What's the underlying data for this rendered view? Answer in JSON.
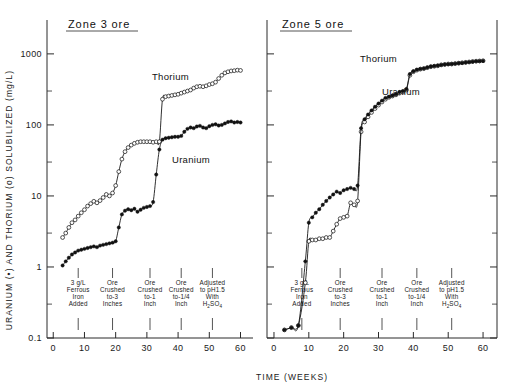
{
  "figure": {
    "width": 510,
    "height": 389,
    "background": "#ffffff",
    "ink_color": "#1a1a1a"
  },
  "axes": {
    "x_title": "TIME (WEEKS)",
    "y_title": "URANIUM (•) AND THORIUM (o) SOLUBILIZED (mg/L)",
    "x_ticks": [
      0,
      10,
      20,
      30,
      40,
      50,
      60
    ],
    "x_ticklabels": [
      "0",
      "10",
      "20",
      "30",
      "40",
      "50",
      "60"
    ],
    "y_ticks": [
      0.1,
      1,
      10,
      100,
      1000
    ],
    "y_ticklabels": [
      "0.1",
      "1",
      "10",
      "100",
      "1000"
    ],
    "y_scale": "log",
    "y_limits": [
      0.1,
      3000
    ],
    "x_limits": [
      -2,
      64
    ],
    "grid": false
  },
  "legend": {
    "position": "inline-annotation",
    "entries": [
      {
        "name": "Thorium",
        "marker": "open-circle"
      },
      {
        "name": "Uranium",
        "marker": "filled-circle"
      }
    ]
  },
  "annotations": {
    "events": [
      {
        "week": 8,
        "lines": [
          "3 g/L",
          "Ferrous",
          "Iron",
          "Added"
        ]
      },
      {
        "week": 19,
        "lines": [
          "Ore",
          "Crushed",
          "to-3",
          "Inches"
        ]
      },
      {
        "week": 31,
        "lines": [
          "Ore",
          "Crushed",
          "to-1",
          "Inch"
        ]
      },
      {
        "week": 41,
        "lines": [
          "Ore",
          "Crushed",
          "to-1/4",
          "Inch"
        ]
      },
      {
        "week": 51,
        "lines": [
          "Adjusted",
          "to pH1.5",
          "With",
          "H2SO4"
        ]
      }
    ]
  },
  "chart_data": [
    {
      "type": "line",
      "panel": "left",
      "title": "Zone 3 ore",
      "xlabel": "TIME (WEEKS)",
      "ylabel": "URANIUM (•) AND THORIUM (o) SOLUBILIZED (mg/L)",
      "xlim": [
        -2,
        64
      ],
      "ylim": [
        0.1,
        3000
      ],
      "yscale": "log",
      "grid": false,
      "series": [
        {
          "name": "Thorium",
          "marker": "open-circle",
          "x": [
            3,
            4,
            5,
            6,
            7,
            8,
            9,
            10,
            11,
            12,
            13,
            14,
            15,
            16,
            17,
            18,
            19,
            20,
            21,
            22,
            23,
            24,
            25,
            26,
            27,
            28,
            29,
            30,
            31,
            32,
            33,
            34,
            35,
            36,
            37,
            38,
            39,
            40,
            41,
            42,
            43,
            44,
            45,
            46,
            47,
            48,
            49,
            50,
            51,
            52,
            53,
            54,
            55,
            56,
            57,
            58,
            59,
            60
          ],
          "y": [
            2.6,
            3.0,
            3.6,
            4.2,
            4.6,
            5.2,
            5.8,
            6.4,
            7.2,
            7.8,
            8.4,
            8.0,
            8.6,
            9.5,
            10.5,
            10.0,
            11.0,
            14,
            22,
            33,
            42,
            48,
            52,
            55,
            57,
            58,
            58,
            58,
            58,
            57,
            58,
            58,
            230,
            250,
            255,
            260,
            265,
            270,
            280,
            290,
            300,
            310,
            330,
            345,
            350,
            345,
            355,
            370,
            380,
            400,
            450,
            500,
            540,
            560,
            575,
            580,
            590,
            585
          ]
        },
        {
          "name": "Uranium",
          "marker": "filled-circle",
          "x": [
            3,
            4,
            5,
            6,
            7,
            8,
            9,
            10,
            11,
            12,
            13,
            14,
            15,
            16,
            17,
            18,
            19,
            20,
            21,
            22,
            23,
            24,
            25,
            26,
            27,
            28,
            29,
            30,
            31,
            32,
            33,
            34,
            35,
            36,
            37,
            38,
            39,
            40,
            41,
            42,
            43,
            44,
            45,
            46,
            47,
            48,
            49,
            50,
            51,
            52,
            53,
            54,
            55,
            56,
            57,
            58,
            59,
            60
          ],
          "y": [
            1.05,
            1.2,
            1.35,
            1.5,
            1.6,
            1.7,
            1.75,
            1.8,
            1.85,
            1.9,
            1.95,
            1.9,
            2.0,
            2.05,
            2.1,
            2.15,
            2.2,
            2.3,
            3.6,
            5.5,
            6.2,
            6.5,
            6.3,
            6.6,
            6.0,
            6.4,
            6.8,
            7.0,
            7.2,
            8.2,
            20,
            45,
            62,
            65,
            66,
            67,
            68,
            68,
            70,
            80,
            88,
            92,
            90,
            95,
            97,
            92,
            90,
            96,
            100,
            102,
            98,
            100,
            105,
            110,
            112,
            108,
            110,
            108
          ]
        }
      ]
    },
    {
      "type": "line",
      "panel": "right",
      "title": "Zone 5 ore",
      "xlabel": "TIME (WEEKS)",
      "ylabel": "URANIUM (•) AND THORIUM (o) SOLUBILIZED (mg/L)",
      "xlim": [
        -2,
        64
      ],
      "ylim": [
        0.1,
        3000
      ],
      "yscale": "log",
      "grid": false,
      "series": [
        {
          "name": "Thorium",
          "marker": "open-circle",
          "x": [
            3,
            5,
            7,
            9,
            10,
            11,
            12,
            13,
            14,
            15,
            16,
            17,
            18,
            19,
            20,
            21,
            22,
            23,
            24,
            25,
            26,
            27,
            28,
            29,
            30,
            31,
            32,
            33,
            34,
            35,
            36,
            37,
            38,
            39,
            40,
            41,
            42,
            43,
            44,
            45,
            46,
            47,
            48,
            49,
            50,
            51,
            52,
            53,
            54,
            55,
            56,
            57,
            58,
            59,
            60
          ],
          "y": [
            0.13,
            0.14,
            0.15,
            0.6,
            2.3,
            2.4,
            2.4,
            2.5,
            2.5,
            2.6,
            2.6,
            3.2,
            4.0,
            4.8,
            5.0,
            5.2,
            8.0,
            7.5,
            8.5,
            80,
            110,
            130,
            150,
            170,
            190,
            210,
            230,
            245,
            255,
            265,
            280,
            290,
            310,
            500,
            560,
            590,
            610,
            620,
            640,
            660,
            670,
            680,
            700,
            710,
            720,
            720,
            730,
            740,
            750,
            760,
            770,
            780,
            790,
            795,
            800
          ]
        },
        {
          "name": "Uranium",
          "marker": "filled-circle",
          "x": [
            3,
            5,
            7,
            9,
            10,
            11,
            12,
            13,
            14,
            15,
            16,
            17,
            18,
            19,
            20,
            21,
            22,
            23,
            24,
            25,
            26,
            27,
            28,
            29,
            30,
            31,
            32,
            33,
            34,
            35,
            36,
            37,
            38,
            39,
            40,
            41,
            42,
            43,
            44,
            45,
            46,
            47,
            48,
            49,
            50,
            51,
            52,
            53,
            54,
            55,
            56,
            57,
            58,
            59,
            60
          ],
          "y": [
            0.13,
            0.14,
            0.15,
            1.2,
            4.2,
            5.0,
            5.8,
            6.5,
            7.5,
            8.5,
            9.5,
            10.5,
            11.5,
            11.0,
            12,
            12.5,
            13,
            12.5,
            14,
            90,
            120,
            140,
            160,
            180,
            200,
            220,
            240,
            250,
            260,
            270,
            290,
            300,
            320,
            520,
            570,
            600,
            615,
            625,
            645,
            665,
            675,
            685,
            700,
            710,
            715,
            720,
            730,
            740,
            745,
            755,
            765,
            775,
            785,
            790,
            795
          ]
        }
      ]
    }
  ]
}
